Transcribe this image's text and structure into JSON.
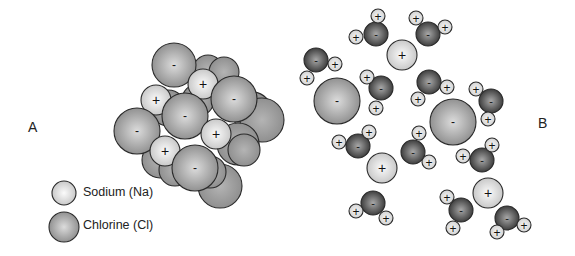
{
  "labels": {
    "panel_a": "A",
    "panel_b": "B",
    "plus": "+",
    "minus": "-"
  },
  "legend": [
    {
      "label": "Sodium (Na)",
      "type": "na",
      "x": 64,
      "y": 193,
      "r": 12
    },
    {
      "label": "Chlorine (Cl)",
      "type": "cl",
      "x": 64,
      "y": 227,
      "r": 15
    }
  ],
  "colors": {
    "na_fill_light": "#f4f4f4",
    "na_fill_dark": "#c9c9c9",
    "cl_fill_light": "#d6d6d6",
    "cl_fill_dark": "#8e8e8e",
    "cl_back_fill": "#a2a2a2",
    "o_fill_light": "#9a9a9a",
    "o_fill_dark": "#3e3e3e",
    "h_fill": "#e6e6e6",
    "stroke": "#2b2b2b"
  },
  "panel_a": {
    "description": "Solid sodium chloride crystal lattice",
    "background_spheres": [
      {
        "x": 208,
        "y": 70,
        "r": 15
      },
      {
        "x": 224,
        "y": 72,
        "r": 15
      },
      {
        "x": 252,
        "y": 112,
        "r": 20
      },
      {
        "x": 262,
        "y": 120,
        "r": 22
      },
      {
        "x": 238,
        "y": 144,
        "r": 21
      },
      {
        "x": 244,
        "y": 150,
        "r": 16
      },
      {
        "x": 220,
        "y": 186,
        "r": 22
      },
      {
        "x": 210,
        "y": 172,
        "r": 16
      },
      {
        "x": 160,
        "y": 160,
        "r": 18
      },
      {
        "x": 175,
        "y": 170,
        "r": 16
      },
      {
        "x": 168,
        "y": 108,
        "r": 18
      },
      {
        "x": 198,
        "y": 100,
        "r": 16
      }
    ],
    "ions": [
      {
        "type": "cl",
        "charge": "-",
        "x": 174,
        "y": 65,
        "r": 22
      },
      {
        "type": "na",
        "charge": "+",
        "x": 203,
        "y": 84,
        "r": 15
      },
      {
        "type": "cl",
        "charge": "-",
        "x": 234,
        "y": 99,
        "r": 23
      },
      {
        "type": "na",
        "charge": "+",
        "x": 156,
        "y": 100,
        "r": 15
      },
      {
        "type": "cl",
        "charge": "-",
        "x": 185,
        "y": 116,
        "r": 23
      },
      {
        "type": "cl",
        "charge": "-",
        "x": 137,
        "y": 131,
        "r": 23
      },
      {
        "type": "na",
        "charge": "+",
        "x": 216,
        "y": 134,
        "r": 15
      },
      {
        "type": "na",
        "charge": "+",
        "x": 165,
        "y": 151,
        "r": 15
      },
      {
        "type": "cl",
        "charge": "-",
        "x": 195,
        "y": 168,
        "r": 23
      }
    ]
  },
  "panel_b": {
    "description": "Sodium and chloride ions dissolved in water, surrounded by water molecules",
    "ions": [
      {
        "type": "cl",
        "charge": "-",
        "x": 337,
        "y": 101,
        "r": 23
      },
      {
        "type": "cl",
        "charge": "-",
        "x": 453,
        "y": 122,
        "r": 23
      },
      {
        "type": "na",
        "charge": "+",
        "x": 402,
        "y": 55,
        "r": 15
      },
      {
        "type": "na",
        "charge": "+",
        "x": 382,
        "y": 168,
        "r": 15
      },
      {
        "type": "na",
        "charge": "+",
        "x": 488,
        "y": 193,
        "r": 15
      }
    ],
    "water_molecules": [
      {
        "o": {
          "x": 376,
          "y": 34
        },
        "h": [
          {
            "x": 378,
            "y": 16
          },
          {
            "x": 356,
            "y": 37
          }
        ]
      },
      {
        "o": {
          "x": 428,
          "y": 34
        },
        "h": [
          {
            "x": 416,
            "y": 18
          },
          {
            "x": 445,
            "y": 27
          }
        ]
      },
      {
        "o": {
          "x": 316,
          "y": 60
        },
        "h": [
          {
            "x": 335,
            "y": 64
          },
          {
            "x": 307,
            "y": 78
          }
        ]
      },
      {
        "o": {
          "x": 381,
          "y": 88
        },
        "h": [
          {
            "x": 367,
            "y": 77
          },
          {
            "x": 376,
            "y": 108
          }
        ]
      },
      {
        "o": {
          "x": 429,
          "y": 82
        },
        "h": [
          {
            "x": 447,
            "y": 87
          },
          {
            "x": 418,
            "y": 99
          }
        ]
      },
      {
        "o": {
          "x": 491,
          "y": 101
        },
        "h": [
          {
            "x": 476,
            "y": 89
          },
          {
            "x": 488,
            "y": 119
          }
        ]
      },
      {
        "o": {
          "x": 358,
          "y": 146
        },
        "h": [
          {
            "x": 369,
            "y": 132
          },
          {
            "x": 339,
            "y": 142
          }
        ]
      },
      {
        "o": {
          "x": 413,
          "y": 152
        },
        "h": [
          {
            "x": 419,
            "y": 133
          },
          {
            "x": 429,
            "y": 162
          }
        ]
      },
      {
        "o": {
          "x": 482,
          "y": 160
        },
        "h": [
          {
            "x": 492,
            "y": 145
          },
          {
            "x": 463,
            "y": 156
          }
        ]
      },
      {
        "o": {
          "x": 373,
          "y": 203
        },
        "h": [
          {
            "x": 356,
            "y": 211
          },
          {
            "x": 386,
            "y": 218
          }
        ]
      },
      {
        "o": {
          "x": 461,
          "y": 210
        },
        "h": [
          {
            "x": 447,
            "y": 197
          },
          {
            "x": 453,
            "y": 228
          }
        ]
      },
      {
        "o": {
          "x": 507,
          "y": 218
        },
        "h": [
          {
            "x": 524,
            "y": 225
          },
          {
            "x": 497,
            "y": 232
          }
        ]
      }
    ],
    "o_radius": 12,
    "h_radius": 7
  }
}
